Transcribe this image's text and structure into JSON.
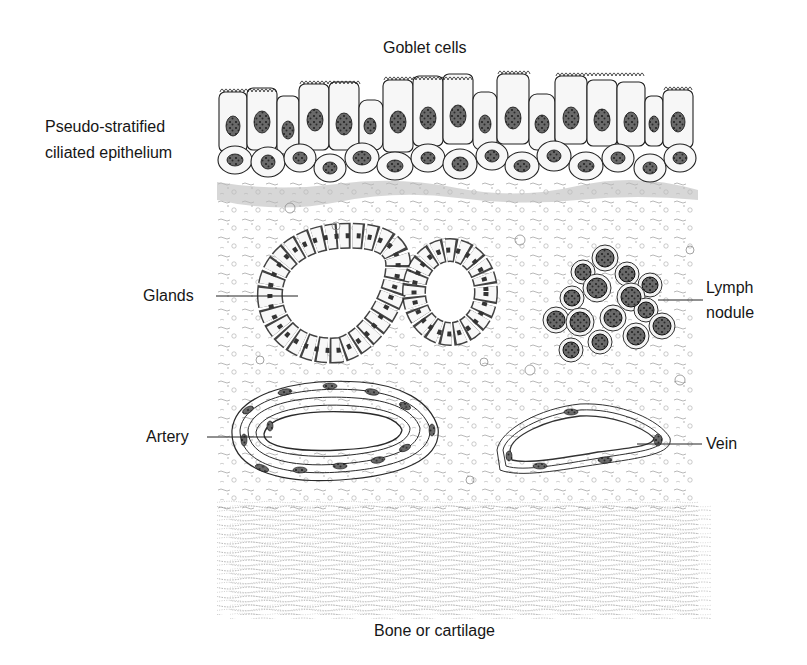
{
  "figure": {
    "labels": {
      "goblet_cells": "Goblet cells",
      "epithelium_line1": "Pseudo-stratified",
      "epithelium_line2": "ciliated epithelium",
      "glands": "Glands",
      "lymph_line1": "Lymph",
      "lymph_line2": "nodule",
      "artery": "Artery",
      "vein": "Vein",
      "bone": "Bone or cartilage"
    }
  }
}
